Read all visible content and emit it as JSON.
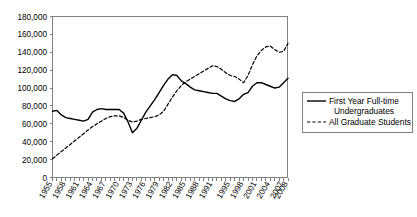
{
  "chart_data": {
    "type": "line",
    "title": "",
    "xlabel": "",
    "ylabel": "",
    "ylim": [
      0,
      180000
    ],
    "xlim": [
      1955,
      2008
    ],
    "grid": false,
    "legend_position": "right",
    "ytick_labels": [
      "180,000",
      "160,000",
      "140,000",
      "120,000",
      "100,000",
      "80,000",
      "60,000",
      "40,000",
      "20,000",
      "0"
    ],
    "ytick_values": [
      180000,
      160000,
      140000,
      120000,
      100000,
      80000,
      60000,
      40000,
      20000,
      0
    ],
    "xtick_labels": [
      "1955",
      "1958",
      "1961",
      "1964",
      "1967",
      "1970",
      "1973",
      "1976",
      "1979",
      "1982",
      "1985",
      "1988",
      "1991",
      "1995",
      "1998",
      "2001",
      "2004",
      "2007",
      "2008"
    ],
    "xtick_values": [
      1955,
      1958,
      1961,
      1964,
      1967,
      1970,
      1973,
      1976,
      1979,
      1982,
      1985,
      1988,
      1991,
      1995,
      1998,
      2001,
      2004,
      2007,
      2008
    ],
    "x": [
      1955,
      1956,
      1957,
      1958,
      1959,
      1960,
      1961,
      1962,
      1963,
      1964,
      1965,
      1966,
      1967,
      1968,
      1969,
      1970,
      1971,
      1972,
      1973,
      1974,
      1975,
      1976,
      1977,
      1978,
      1979,
      1980,
      1981,
      1982,
      1983,
      1984,
      1985,
      1986,
      1987,
      1988,
      1989,
      1990,
      1991,
      1992,
      1993,
      1994,
      1995,
      1996,
      1997,
      1998,
      1999,
      2000,
      2001,
      2002,
      2003,
      2004,
      2005,
      2006,
      2007,
      2008
    ],
    "series": [
      {
        "name": "First Year Full-time Undergraduates",
        "style": "solid",
        "color": "#000000",
        "values": [
          74000,
          75000,
          70000,
          67000,
          66000,
          65000,
          64000,
          63000,
          65000,
          73000,
          76000,
          77000,
          76000,
          76000,
          76000,
          76000,
          72000,
          62000,
          50000,
          55000,
          64000,
          73000,
          80000,
          87000,
          95000,
          103000,
          110000,
          115000,
          114000,
          108000,
          105000,
          101000,
          98000,
          97000,
          96000,
          95000,
          94000,
          94000,
          91000,
          88000,
          86000,
          85000,
          88000,
          93000,
          95000,
          102000,
          106000,
          106000,
          104000,
          102000,
          100000,
          101000,
          106000,
          111000
        ]
      },
      {
        "name": "All Graduate Students",
        "style": "dashed",
        "color": "#000000",
        "values": [
          21000,
          25000,
          29000,
          33000,
          37000,
          41000,
          45000,
          49000,
          53000,
          57000,
          60000,
          63000,
          66000,
          68000,
          69000,
          69000,
          67000,
          64000,
          62000,
          63000,
          65000,
          66000,
          67000,
          68000,
          70000,
          74000,
          82000,
          90000,
          97000,
          103000,
          107000,
          110000,
          113000,
          116000,
          119000,
          122000,
          125000,
          124000,
          121000,
          117000,
          114000,
          113000,
          110000,
          106000,
          114000,
          126000,
          136000,
          142000,
          146000,
          147000,
          143000,
          140000,
          141000,
          150000
        ]
      }
    ]
  },
  "legend": {
    "entries": [
      {
        "label_line1": "First Year Full-time",
        "label_line2": "Undergraduates",
        "style": "solid"
      },
      {
        "label_line1": "All Graduate Students",
        "label_line2": "",
        "style": "dashed"
      }
    ]
  }
}
